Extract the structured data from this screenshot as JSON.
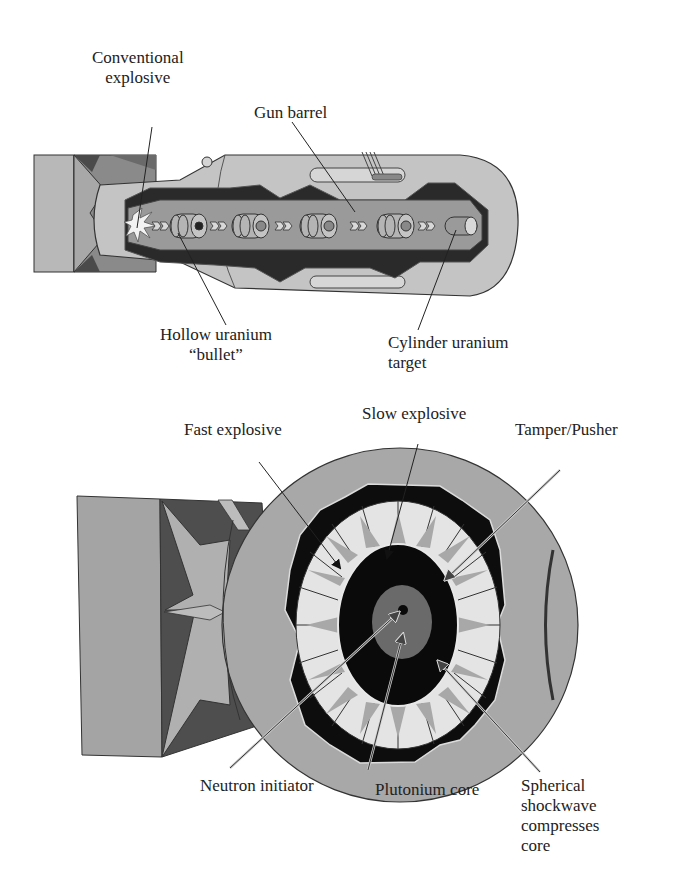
{
  "gun_type": {
    "labels": {
      "conventional_explosive": [
        "Conventional",
        "explosive"
      ],
      "gun_barrel": "Gun barrel",
      "hollow_uranium_bullet": [
        "Hollow uranium",
        "“bullet”"
      ],
      "cylinder_uranium_target": [
        "Cylinder uranium",
        "target"
      ]
    }
  },
  "implosion_type": {
    "labels": {
      "fast_explosive": "Fast explosive",
      "slow_explosive": "Slow explosive",
      "tamper_pusher": "Tamper/Pusher",
      "neutron_initiator": "Neutron initiator",
      "plutonium_core": "Plutonium core",
      "spherical_shockwave": [
        "Spherical",
        "shockwave",
        "compresses",
        "core"
      ]
    }
  },
  "colors": {
    "fin_light": "#b8b8b8",
    "fin_dark": "#5a5a5a",
    "body": "#c4c4c4",
    "body_outline": "#3a3a3a",
    "barrel_dark": "#2a2a2a",
    "barrel_mid": "#9a9a9a",
    "lens_light": "#e4e4e4",
    "lens_spike": "#a8a8a8",
    "tamper": "#0a0a0a",
    "core": "#6a6a6a"
  }
}
